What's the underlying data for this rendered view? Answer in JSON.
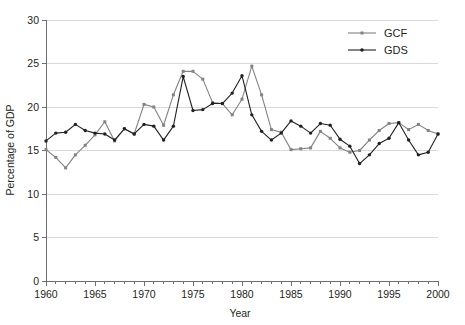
{
  "chart_data": {
    "type": "line",
    "title": "",
    "xlabel": "Year",
    "ylabel": "Percentage of GDP",
    "xlim": [
      1960,
      2000
    ],
    "ylim": [
      0,
      30
    ],
    "ytick_labels": [
      "0",
      "5",
      "10",
      "15",
      "20",
      "25",
      "30"
    ],
    "yticks": [
      0,
      5,
      10,
      15,
      20,
      25,
      30
    ],
    "xtick_labels": [
      "1960",
      "1965",
      "1970",
      "1975",
      "1980",
      "1985",
      "1990",
      "1995",
      "2000"
    ],
    "xticks": [
      1960,
      1965,
      1970,
      1975,
      1980,
      1985,
      1990,
      1995,
      2000
    ],
    "minor_xticks_interval": 1,
    "grid": "horizontal",
    "legend_position": "top-right",
    "x": [
      1960,
      1961,
      1962,
      1963,
      1964,
      1965,
      1966,
      1967,
      1968,
      1969,
      1970,
      1971,
      1972,
      1973,
      1974,
      1975,
      1976,
      1977,
      1978,
      1979,
      1980,
      1981,
      1982,
      1983,
      1984,
      1985,
      1986,
      1987,
      1988,
      1989,
      1990,
      1991,
      1992,
      1993,
      1994,
      1995,
      1996,
      1997,
      1998,
      1999,
      2000
    ],
    "series": [
      {
        "name": "GCF",
        "color": "#808285",
        "marker": "square",
        "values": [
          15.1,
          14.2,
          13.0,
          14.5,
          15.6,
          16.8,
          18.3,
          16.1,
          17.5,
          16.9,
          20.3,
          20.0,
          17.9,
          21.4,
          24.1,
          24.1,
          23.2,
          20.5,
          20.4,
          19.1,
          20.9,
          24.7,
          21.4,
          17.4,
          17.1,
          15.1,
          15.2,
          15.3,
          17.2,
          16.4,
          15.3,
          14.8,
          15.0,
          16.2,
          17.3,
          18.1,
          18.2,
          17.4,
          18.0,
          17.3,
          16.9
        ]
      },
      {
        "name": "GDS",
        "color": "#231f20",
        "marker": "circle",
        "values": [
          16.1,
          17.0,
          17.1,
          18.0,
          17.3,
          17.0,
          16.9,
          16.2,
          17.5,
          16.9,
          18.0,
          17.8,
          16.2,
          17.8,
          23.5,
          19.6,
          19.7,
          20.4,
          20.4,
          21.6,
          23.6,
          19.1,
          17.2,
          16.2,
          17.0,
          18.4,
          17.8,
          17.0,
          18.1,
          17.9,
          16.3,
          15.5,
          13.5,
          14.5,
          15.8,
          16.4,
          18.2,
          16.2,
          14.5,
          14.8,
          16.9
        ]
      }
    ]
  },
  "legend": {
    "items": [
      {
        "label": "GCF"
      },
      {
        "label": "GDS"
      }
    ]
  },
  "axes": {
    "x_title": "Year",
    "y_title": "Percentage of GDP"
  }
}
